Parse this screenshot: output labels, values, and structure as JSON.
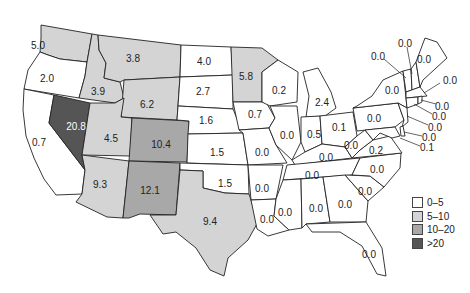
{
  "map": {
    "type": "choropleth",
    "region": "Contiguous United States",
    "colors": {
      "0-5": "#ffffff",
      "5-10": "#d4d4d4",
      "10-20": "#a8a8a8",
      ">20": "#555555"
    },
    "states": [
      {
        "name": "Washington",
        "value": "5.0",
        "class": "5-10",
        "x": 38,
        "y": 45
      },
      {
        "name": "Oregon",
        "value": "2.0",
        "class": "0-5",
        "x": 47,
        "y": 78
      },
      {
        "name": "California",
        "value": "0.7",
        "class": "0-5",
        "x": 39,
        "y": 142
      },
      {
        "name": "Nevada",
        "value": "20.8",
        "class": ">20",
        "x": 76,
        "y": 126
      },
      {
        "name": "Idaho",
        "value": "3.9",
        "class": "5-10",
        "x": 98,
        "y": 91
      },
      {
        "name": "Montana",
        "value": "3.8",
        "class": "5-10",
        "x": 133,
        "y": 58
      },
      {
        "name": "Wyoming",
        "value": "6.2",
        "class": "5-10",
        "x": 147,
        "y": 104
      },
      {
        "name": "Utah",
        "value": "4.5",
        "class": "5-10",
        "x": 111,
        "y": 138
      },
      {
        "name": "Colorado",
        "value": "10.4",
        "class": "10-20",
        "x": 161,
        "y": 144
      },
      {
        "name": "Arizona",
        "value": "9.3",
        "class": "5-10",
        "x": 100,
        "y": 184
      },
      {
        "name": "New Mexico",
        "value": "12.1",
        "class": "10-20",
        "x": 150,
        "y": 190
      },
      {
        "name": "North Dakota",
        "value": "4.0",
        "class": "0-5",
        "x": 204,
        "y": 61
      },
      {
        "name": "South Dakota",
        "value": "2.7",
        "class": "0-5",
        "x": 203,
        "y": 91
      },
      {
        "name": "Nebraska",
        "value": "1.6",
        "class": "0-5",
        "x": 206,
        "y": 120
      },
      {
        "name": "Kansas",
        "value": "1.5",
        "class": "0-5",
        "x": 217,
        "y": 152
      },
      {
        "name": "Oklahoma",
        "value": "1.5",
        "class": "0-5",
        "x": 225,
        "y": 183
      },
      {
        "name": "Texas",
        "value": "9.4",
        "class": "5-10",
        "x": 210,
        "y": 221
      },
      {
        "name": "Minnesota",
        "value": "5.8",
        "class": "5-10",
        "x": 246,
        "y": 76
      },
      {
        "name": "Iowa",
        "value": "0.7",
        "class": "0-5",
        "x": 255,
        "y": 114
      },
      {
        "name": "Missouri",
        "value": "0.0",
        "class": "0-5",
        "x": 262,
        "y": 152
      },
      {
        "name": "Arkansas",
        "value": "0.0",
        "class": "0-5",
        "x": 262,
        "y": 188
      },
      {
        "name": "Louisiana",
        "value": "0.0",
        "class": "0-5",
        "x": 267,
        "y": 219
      },
      {
        "name": "Wisconsin",
        "value": "0.2",
        "class": "0-5",
        "x": 279,
        "y": 90
      },
      {
        "name": "Illinois",
        "value": "0.0",
        "class": "0-5",
        "x": 287,
        "y": 135
      },
      {
        "name": "Michigan",
        "value": "2.4",
        "class": "0-5",
        "x": 322,
        "y": 102
      },
      {
        "name": "Indiana",
        "value": "0.5",
        "class": "0-5",
        "x": 314,
        "y": 134
      },
      {
        "name": "Ohio",
        "value": "0.1",
        "class": "0-5",
        "x": 339,
        "y": 127
      },
      {
        "name": "Kentucky",
        "value": "0.0",
        "class": "0-5",
        "x": 326,
        "y": 157
      },
      {
        "name": "Tennessee",
        "value": "0.0",
        "class": "0-5",
        "x": 312,
        "y": 175
      },
      {
        "name": "Mississippi",
        "value": "0.0",
        "class": "0-5",
        "x": 285,
        "y": 212
      },
      {
        "name": "Alabama",
        "value": "0.0",
        "class": "0-5",
        "x": 316,
        "y": 208
      },
      {
        "name": "Georgia",
        "value": "0.0",
        "class": "0-5",
        "x": 345,
        "y": 204
      },
      {
        "name": "Florida",
        "value": "0.0",
        "class": "0-5",
        "x": 369,
        "y": 254
      },
      {
        "name": "South Carolina",
        "value": "0.0",
        "class": "0-5",
        "x": 365,
        "y": 191
      },
      {
        "name": "North Carolina",
        "value": "0.0",
        "class": "0-5",
        "x": 377,
        "y": 169
      },
      {
        "name": "Virginia",
        "value": "0.2",
        "class": "0-5",
        "x": 376,
        "y": 150
      },
      {
        "name": "West Virginia",
        "value": "0.0",
        "class": "0-5",
        "x": 351,
        "y": 145
      },
      {
        "name": "Pennsylvania",
        "value": "0.0",
        "class": "0-5",
        "x": 374,
        "y": 118
      },
      {
        "name": "New York",
        "value": "0.0",
        "class": "0-5",
        "x": 392,
        "y": 90
      },
      {
        "name": "Vermont",
        "value": "0.0",
        "class": "0-5",
        "x": 378,
        "y": 56
      },
      {
        "name": "New Hampshire",
        "value": "0.0",
        "class": "0-5",
        "x": 405,
        "y": 43
      },
      {
        "name": "Maine",
        "value": "0.0",
        "class": "0-5",
        "x": 424,
        "y": 59
      },
      {
        "name": "Massachusetts",
        "value": "0.0",
        "class": "0-5",
        "x": 450,
        "y": 80
      },
      {
        "name": "Rhode Island",
        "value": "0.0",
        "class": "0-5",
        "x": 442,
        "y": 106
      },
      {
        "name": "Connecticut",
        "value": "0.0",
        "class": "0-5",
        "x": 439,
        "y": 116
      },
      {
        "name": "New Jersey",
        "value": "0.0",
        "class": "0-5",
        "x": 435,
        "y": 127
      },
      {
        "name": "Delaware",
        "value": "0.0",
        "class": "0-5",
        "x": 429,
        "y": 137
      },
      {
        "name": "Maryland",
        "value": "0.1",
        "class": "0-5",
        "x": 427,
        "y": 147
      }
    ]
  },
  "legend": {
    "items": [
      {
        "label": "0–5",
        "color": "#ffffff"
      },
      {
        "label": "5–10",
        "color": "#d4d4d4"
      },
      {
        "label": "10–20",
        "color": "#a8a8a8"
      },
      {
        "label": ">20",
        "color": "#555555"
      }
    ]
  }
}
